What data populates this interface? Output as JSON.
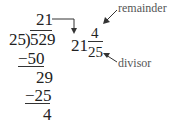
{
  "division": {
    "quotient": "21",
    "divisor": "25",
    "dividend": "529",
    "steps": [
      {
        "subtract": "−50",
        "result": "29"
      },
      {
        "subtract": "−25",
        "result": "4"
      }
    ]
  },
  "mixed_number": {
    "whole": "21",
    "numerator": "4",
    "denominator": "25"
  },
  "annotations": {
    "remainder_label": "remainder",
    "divisor_label": "divisor"
  }
}
